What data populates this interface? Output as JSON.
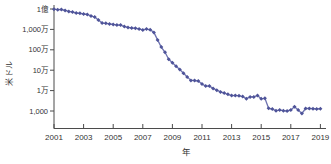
{
  "figure": {
    "y_axis_title": "米ドル",
    "x_axis_title": "年"
  },
  "colors": {
    "line": "#6e73b0",
    "marker": "#4f5499",
    "axis": "#4b4b4b",
    "label": "#333333",
    "background": "#ffffff"
  },
  "chart_data": {
    "type": "line",
    "title": "",
    "xlabel": "年",
    "ylabel": "米ドル",
    "y_scale": "log",
    "grid": false,
    "legend": false,
    "xlim": [
      2001,
      2019.6
    ],
    "ylim": [
      1000,
      100000000
    ],
    "x_ticks": [
      2001,
      2003,
      2005,
      2007,
      2009,
      2011,
      2013,
      2015,
      2017,
      2019
    ],
    "x_tick_labels": [
      "2001",
      "2003",
      "2005",
      "2007",
      "2009",
      "2011",
      "2013",
      "2015",
      "2017",
      "2019"
    ],
    "y_ticks": [
      100000000,
      10000000,
      1000000,
      100000,
      10000,
      1000
    ],
    "y_tick_labels": [
      "1億",
      "1,000万",
      "100万",
      "10万",
      "1万",
      "1,000"
    ],
    "x": [
      2001.0,
      2001.25,
      2001.5,
      2001.75,
      2002.0,
      2002.25,
      2002.5,
      2002.75,
      2003.0,
      2003.25,
      2003.5,
      2003.75,
      2004.0,
      2004.25,
      2004.5,
      2004.75,
      2005.0,
      2005.25,
      2005.5,
      2005.75,
      2006.0,
      2006.25,
      2006.5,
      2006.75,
      2007.0,
      2007.25,
      2007.5,
      2007.75,
      2008.0,
      2008.25,
      2008.5,
      2008.75,
      2009.0,
      2009.25,
      2009.5,
      2009.75,
      2010.0,
      2010.25,
      2010.5,
      2010.75,
      2011.0,
      2011.25,
      2011.5,
      2011.75,
      2012.0,
      2012.25,
      2012.5,
      2012.75,
      2013.0,
      2013.25,
      2013.5,
      2013.75,
      2014.0,
      2014.25,
      2014.5,
      2014.75,
      2015.0,
      2015.25,
      2015.5,
      2015.75,
      2016.0,
      2016.25,
      2016.5,
      2016.75,
      2017.0,
      2017.25,
      2017.5,
      2017.75,
      2018.0,
      2018.25,
      2018.5,
      2018.75,
      2019.0
    ],
    "values": [
      98000000,
      92000000,
      95000000,
      85000000,
      76000000,
      70175437,
      64000000,
      61448422,
      57000000,
      53751684,
      46000000,
      40157554,
      28780376,
      20442576,
      19934346,
      18519312,
      17534970,
      16159699,
      16180224,
      13801124,
      12585659,
      11732535,
      11455315,
      10474556,
      9408739,
      10314621,
      9526324,
      7147571,
      3063820,
      1352982,
      752080,
      342502,
      232735,
      154714,
      108065,
      70333,
      46774,
      31512,
      31125,
      29092,
      20963,
      16712,
      16615,
      12862,
      10497,
      8594,
      7566,
      6618,
      5671,
      5826,
      5550,
      5096,
      4008,
      4920,
      4905,
      5731,
      3970,
      4211,
      1363,
      1245,
      1037,
      1109,
      1033,
      999,
      1121,
      1625,
      1121,
      750,
      1331,
      1333,
      1295,
      1250,
      1300
    ]
  }
}
